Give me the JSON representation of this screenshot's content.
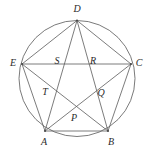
{
  "figure": {
    "type": "geometry-diagram",
    "background_color": "#ffffff",
    "stroke_color": "#5a5a5a",
    "label_color": "#2b2b2b",
    "circle": {
      "cx": 77,
      "cy": 78.5,
      "r": 58
    },
    "vertices": [
      {
        "id": "D",
        "label": "D",
        "x": 77,
        "y": 20.5,
        "label_x": 77,
        "label_y": 10,
        "on_circle": true
      },
      {
        "id": "C",
        "label": "C",
        "x": 131,
        "y": 64,
        "label_x": 139,
        "label_y": 64,
        "on_circle": true
      },
      {
        "id": "B",
        "label": "B",
        "x": 108,
        "y": 131,
        "label_x": 111,
        "label_y": 143,
        "on_circle": true
      },
      {
        "id": "A",
        "label": "A",
        "x": 45,
        "y": 131,
        "label_x": 44,
        "label_y": 143,
        "on_circle": true
      },
      {
        "id": "E",
        "label": "E",
        "x": 22,
        "y": 64,
        "label_x": 13,
        "label_y": 64,
        "on_circle": true
      }
    ],
    "intersections": [
      {
        "id": "S",
        "label": "S",
        "x": 62,
        "y": 64,
        "label_x": 57,
        "label_y": 62
      },
      {
        "id": "R",
        "label": "R",
        "x": 98,
        "y": 64,
        "label_x": 93,
        "label_y": 62
      },
      {
        "id": "T",
        "label": "T",
        "x": 52,
        "y": 91,
        "label_x": 45,
        "label_y": 93
      },
      {
        "id": "Q",
        "label": "Q",
        "x": 95,
        "y": 91,
        "label_x": 101,
        "label_y": 94
      },
      {
        "id": "P",
        "label": "P",
        "x": 76,
        "y": 110,
        "label_x": 74,
        "label_y": 119
      }
    ],
    "chords": [
      {
        "from": "A",
        "to": "B",
        "name": "chord-a-b"
      },
      {
        "from": "B",
        "to": "C",
        "name": "chord-b-c"
      },
      {
        "from": "C",
        "to": "D",
        "name": "chord-c-d"
      },
      {
        "from": "D",
        "to": "E",
        "name": "chord-d-e"
      },
      {
        "from": "E",
        "to": "A",
        "name": "chord-e-a"
      },
      {
        "from": "A",
        "to": "C",
        "name": "chord-a-c"
      },
      {
        "from": "A",
        "to": "D",
        "name": "chord-a-d"
      },
      {
        "from": "B",
        "to": "D",
        "name": "chord-b-d"
      },
      {
        "from": "B",
        "to": "E",
        "name": "chord-b-e"
      },
      {
        "from": "C",
        "to": "E",
        "name": "chord-c-e"
      }
    ]
  }
}
